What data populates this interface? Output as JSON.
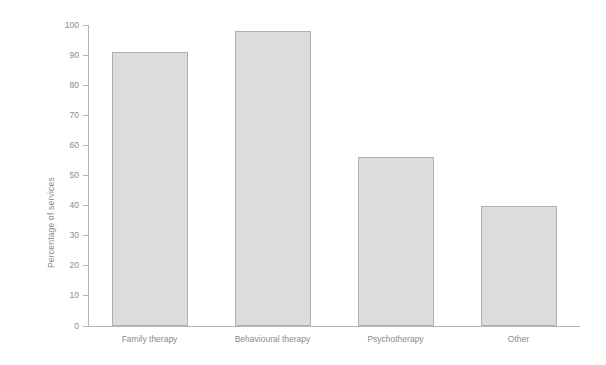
{
  "chart_data": {
    "type": "bar",
    "title": "",
    "xlabel": "",
    "ylabel": "Percentage of services",
    "categories": [
      "Family therapy",
      "Behavioural therapy",
      "Psychotherapy",
      "Other"
    ],
    "values": [
      91,
      98,
      56,
      40
    ],
    "ylim": [
      0,
      100
    ],
    "ytick_labels": [
      "0",
      "10",
      "20",
      "30",
      "40",
      "50",
      "60",
      "70",
      "80",
      "90",
      "100"
    ],
    "ytick_values": [
      0,
      10,
      20,
      30,
      40,
      50,
      60,
      70,
      80,
      90,
      100
    ],
    "grid": false,
    "legend": false,
    "colors": {
      "bar_fill": "#dcdcdc",
      "bar_border": "#b0b0b0",
      "axis": "#b5b5b5",
      "text": "#8a8a8a",
      "background": "#ffffff"
    }
  }
}
